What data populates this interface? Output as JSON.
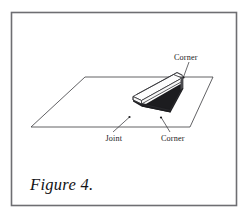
{
  "figure": {
    "caption": "Figure 4.",
    "border_color": "#6e6e72",
    "line_color": "#3a3a3e",
    "shadow_color": "#1c1c1f",
    "background": "#ffffff",
    "labels": {
      "corner_top": "Corner",
      "joint": "Joint",
      "corner_bottom": "Corner"
    },
    "icons": {
      "ground_plane": "ground-plane-parallelogram",
      "slab": "rectangular-slab-isometric"
    }
  }
}
